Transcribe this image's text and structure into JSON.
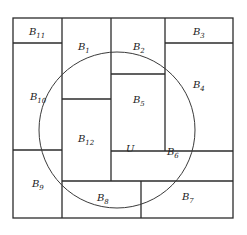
{
  "diagram": {
    "outer_box": {
      "x": 13,
      "y": 18,
      "w": 220,
      "h": 200
    },
    "circle": {
      "label": "U",
      "cx": 117,
      "cy": 130,
      "r": 78
    },
    "blocks": [
      {
        "id": "B1",
        "base": "B",
        "sub": "1",
        "lx": 78,
        "ly": 50
      },
      {
        "id": "B2",
        "base": "B",
        "sub": "2",
        "lx": 133,
        "ly": 50
      },
      {
        "id": "B3",
        "base": "B",
        "sub": "3",
        "lx": 193,
        "ly": 35
      },
      {
        "id": "B4",
        "base": "B",
        "sub": "4",
        "lx": 193,
        "ly": 88
      },
      {
        "id": "B5",
        "base": "B",
        "sub": "5",
        "lx": 133,
        "ly": 103
      },
      {
        "id": "B6",
        "base": "B",
        "sub": "6",
        "lx": 167,
        "ly": 155
      },
      {
        "id": "B7",
        "base": "B",
        "sub": "7",
        "lx": 182,
        "ly": 200
      },
      {
        "id": "B8",
        "base": "B",
        "sub": "8",
        "lx": 97,
        "ly": 201
      },
      {
        "id": "B9",
        "base": "B",
        "sub": "9",
        "lx": 32,
        "ly": 187
      },
      {
        "id": "B10",
        "base": "B",
        "sub": "10",
        "lx": 30,
        "ly": 100
      },
      {
        "id": "B11",
        "base": "B",
        "sub": "11",
        "lx": 29,
        "ly": 35
      },
      {
        "id": "B12",
        "base": "B",
        "sub": "12",
        "lx": 78,
        "ly": 142
      }
    ],
    "u_label": {
      "text": "U",
      "lx": 126,
      "ly": 152
    }
  }
}
